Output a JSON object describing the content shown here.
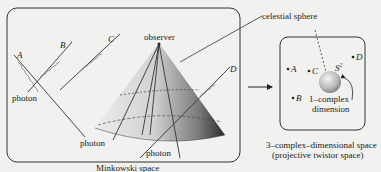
{
  "minkowski": {
    "caption": "Minkowski space",
    "observer_label": "observer",
    "photon_labels": [
      "photon",
      "photon",
      "photon"
    ],
    "ray_labels": [
      "A",
      "B",
      "C",
      "D"
    ]
  },
  "celestial_label": "celestial sphere",
  "twistor": {
    "points": [
      "A",
      "B",
      "C",
      "D"
    ],
    "sphere_label": "S",
    "sphere_sup": "2",
    "dimension_label_line1": "1–complex",
    "dimension_label_line2": "dimension",
    "caption_line1": "3–complex–dimensional space",
    "caption_line2": "(projective twistor space)"
  },
  "colors": {
    "background": "#f1f1ef",
    "ink": "#222222",
    "cone_dark": "#2a2a2a",
    "cone_light": "#d8d8d8"
  }
}
